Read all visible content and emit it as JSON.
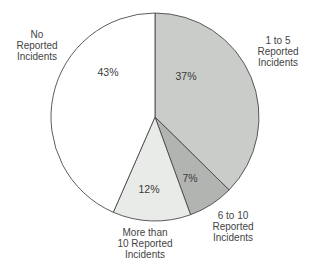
{
  "chart_data": {
    "type": "pie",
    "title": "",
    "categories": [
      "1 to 5 Reported Incidents",
      "6 to 10 Reported Incidents",
      "More than 10 Reported Incidents",
      "No Reported Incidents"
    ],
    "values": [
      37,
      7,
      12,
      43
    ],
    "unit": "%",
    "start_angle_deg": 0,
    "direction": "clockwise",
    "legend": "none (direct labels)",
    "slices": [
      {
        "label_lines": [
          "1 to 5",
          "Reported",
          "Incidents"
        ],
        "value": 37,
        "value_label": "37%",
        "color": "#c9ccc8"
      },
      {
        "label_lines": [
          "6 to 10",
          "Reported",
          "Incidents"
        ],
        "value": 7,
        "value_label": "7%",
        "color": "#b1b4b0"
      },
      {
        "label_lines": [
          "More than",
          "10 Reported",
          "Incidents"
        ],
        "value": 12,
        "value_label": "12%",
        "color": "#e9ebe8"
      },
      {
        "label_lines": [
          "No",
          "Reported",
          "Incidents"
        ],
        "value": 43,
        "value_label": "43%",
        "color": "#ffffff"
      }
    ]
  }
}
